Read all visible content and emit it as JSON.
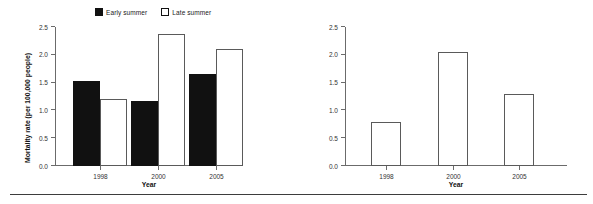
{
  "figure": {
    "bottom_rule": true
  },
  "left_chart": {
    "legend": [
      {
        "label": "Early summer",
        "marker": "filled-square-icon",
        "color": "#111111"
      },
      {
        "label": "Late summer",
        "marker": "hollow-square-icon",
        "color": "#ffffff"
      }
    ],
    "ylabel": "Mortality rate (per 100,000 people)",
    "xlabel": "Year",
    "yticks": [
      "0.0",
      "0.5",
      "1.0",
      "1.5",
      "2.0",
      "2.5"
    ],
    "categories": [
      "1998",
      "2000",
      "2005"
    ]
  },
  "right_chart": {
    "ylabel": "Relative risk",
    "xlabel": "Year",
    "yticks": [
      "0.0",
      "0.5",
      "1.0",
      "1.5",
      "2.0",
      "2.5"
    ],
    "categories": [
      "1998",
      "2000",
      "2005"
    ]
  },
  "chart_data": [
    {
      "type": "bar",
      "title": "",
      "xlabel": "Year",
      "ylabel": "Mortality rate (per 100,000 people)",
      "categories": [
        "1998",
        "2000",
        "2005"
      ],
      "series": [
        {
          "name": "Early summer",
          "values": [
            1.53,
            1.17,
            1.65
          ],
          "color": "#111111"
        },
        {
          "name": "Late summer",
          "values": [
            1.21,
            2.37,
            2.1
          ],
          "color": "#ffffff"
        }
      ],
      "ylim": [
        0.0,
        2.5
      ],
      "ytick_step": 0.5,
      "grid": false,
      "legend_position": "top"
    },
    {
      "type": "bar",
      "title": "",
      "xlabel": "Year",
      "ylabel": "Relative risk",
      "categories": [
        "1998",
        "2000",
        "2005"
      ],
      "values": [
        0.79,
        2.05,
        1.29
      ],
      "bar_color": "#ffffff",
      "bar_edge_color": "#5a5a5a",
      "ylim": [
        0.0,
        2.5
      ],
      "ytick_step": 0.5,
      "grid": false,
      "legend_position": "none"
    }
  ]
}
